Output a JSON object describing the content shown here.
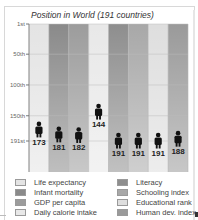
{
  "chart_data": {
    "type": "bar",
    "title": "Position in World (191 countries)",
    "xlabel": "",
    "ylabel": "",
    "ylim": [
      1,
      191
    ],
    "y_inverted": true,
    "yticks": [
      {
        "value": 1,
        "label": "1st"
      },
      {
        "value": 50,
        "label": "50th"
      },
      {
        "value": 100,
        "label": "100th"
      },
      {
        "value": 150,
        "label": "150th"
      },
      {
        "value": 191,
        "label": "191st"
      }
    ],
    "grid": true,
    "legend_placement": "bottom",
    "categories": [
      "Life expectancy",
      "Infant mortality",
      "GDP per capita",
      "Daily calorie intake",
      "Literacy",
      "Schooling index",
      "Educational rank",
      "Human dev. index"
    ],
    "values": [
      173,
      181,
      182,
      144,
      191,
      191,
      191,
      188
    ],
    "colors": [
      "#e4e4e4",
      "#8a8a8a",
      "#9c9c9c",
      "#e8e8e8",
      "#8e8e8e",
      "#a8a8a8",
      "#dedede",
      "#9a9a9a"
    ],
    "marker": "person-icon"
  }
}
